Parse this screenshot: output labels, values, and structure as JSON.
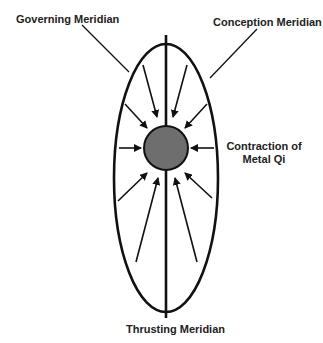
{
  "labels": {
    "governing": "Governing Meridian",
    "conception": "Conception Meridian",
    "contraction_line1": "Contraction of",
    "contraction_line2": "Metal Qi",
    "thrusting": "Thrusting Meridian"
  },
  "colors": {
    "stroke": "#111111",
    "circle_fill": "#6e6e6e",
    "text": "#222222"
  },
  "shapes": {
    "ellipse": {
      "cx": 166,
      "cy": 178,
      "rx": 52,
      "ry": 134
    },
    "axis": {
      "x": 166,
      "y1": 35,
      "y2": 318
    },
    "circle": {
      "cx": 166,
      "cy": 148,
      "r": 22
    },
    "arrows": [
      {
        "from": [
          143,
          65
        ],
        "to": [
          157,
          117
        ]
      },
      {
        "from": [
          187,
          65
        ],
        "to": [
          173,
          117
        ]
      },
      {
        "from": [
          125,
          104
        ],
        "to": [
          147,
          128
        ]
      },
      {
        "from": [
          207,
          104
        ],
        "to": [
          185,
          128
        ]
      },
      {
        "from": [
          119,
          148
        ],
        "to": [
          141,
          148
        ]
      },
      {
        "from": [
          214,
          148
        ],
        "to": [
          191,
          148
        ]
      },
      {
        "from": [
          118,
          201
        ],
        "to": [
          147,
          173
        ]
      },
      {
        "from": [
          212,
          198
        ],
        "to": [
          185,
          173
        ]
      },
      {
        "from": [
          136,
          262
        ],
        "to": [
          158,
          178
        ]
      },
      {
        "from": [
          197,
          262
        ],
        "to": [
          175,
          178
        ]
      }
    ],
    "leaders": [
      {
        "name": "governing",
        "from": [
          82,
          25
        ],
        "to": [
          129,
          72
        ]
      },
      {
        "name": "conception",
        "from": [
          257,
          29
        ],
        "to": [
          210,
          78
        ]
      }
    ]
  }
}
